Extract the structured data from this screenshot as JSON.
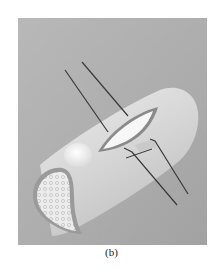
{
  "figure": {
    "caption": "(b)",
    "colors": {
      "background": "#b3b3b3",
      "cylinder": "#dadada",
      "cylinder_highlight": "#efefef",
      "incision_fill": "#f7f7f7",
      "incision_rim": "#8a8a8a",
      "cross_section": "#e6e6e6",
      "cortex_edge": "#9a9a9a",
      "suture": "#3a3a3a",
      "nodule": "#f2f2f2"
    }
  }
}
